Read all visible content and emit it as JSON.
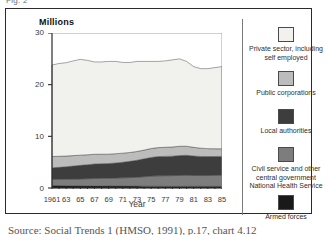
{
  "figure": {
    "number_label": "Fig. 2",
    "caption": "Source: Social Trends 1 (HMSO, 1991), p.17, chart 4.12"
  },
  "chart_data": {
    "type": "area",
    "stacked": true,
    "title": "",
    "ylabel": "Millions",
    "xlabel": "Year",
    "ylim": [
      0,
      30
    ],
    "yticks": [
      0,
      10,
      20,
      30
    ],
    "ytick_labels": [
      "0",
      "10",
      "20",
      "30"
    ],
    "xlim": [
      1961,
      1985
    ],
    "xticks": [
      1961,
      1963,
      1965,
      1967,
      1969,
      1971,
      1973,
      1975,
      1977,
      1979,
      1981,
      1983,
      1985
    ],
    "xtick_labels": [
      "1961",
      "63",
      "65",
      "67",
      "69",
      "71",
      "73",
      "75",
      "77",
      "79",
      "81",
      "83",
      "85"
    ],
    "grid": false,
    "legend_position": "right",
    "x": [
      1961,
      1962,
      1963,
      1964,
      1965,
      1966,
      1967,
      1968,
      1969,
      1970,
      1971,
      1972,
      1973,
      1974,
      1975,
      1976,
      1977,
      1978,
      1979,
      1980,
      1981,
      1982,
      1983,
      1984,
      1985
    ],
    "series": [
      {
        "name": "Armed forces",
        "color": "#191919",
        "values": [
          0.5,
          0.48,
          0.46,
          0.45,
          0.44,
          0.43,
          0.43,
          0.42,
          0.41,
          0.4,
          0.39,
          0.38,
          0.37,
          0.36,
          0.35,
          0.34,
          0.33,
          0.32,
          0.32,
          0.33,
          0.33,
          0.33,
          0.32,
          0.32,
          0.32
        ]
      },
      {
        "name": "Civil service and other central government National Health Service",
        "color": "#7d7d7d",
        "values": [
          1.2,
          1.22,
          1.25,
          1.28,
          1.32,
          1.36,
          1.42,
          1.46,
          1.48,
          1.52,
          1.58,
          1.64,
          1.72,
          1.82,
          1.95,
          2.02,
          2.05,
          2.08,
          2.12,
          2.14,
          2.1,
          2.08,
          2.1,
          2.14,
          2.18
        ]
      },
      {
        "name": "Local authorities",
        "color": "#3d3d3d",
        "values": [
          2.2,
          2.3,
          2.4,
          2.52,
          2.62,
          2.72,
          2.8,
          2.82,
          2.84,
          2.92,
          3.02,
          3.14,
          3.28,
          3.46,
          3.62,
          3.72,
          3.74,
          3.76,
          3.84,
          3.86,
          3.76,
          3.7,
          3.66,
          3.64,
          3.62
        ]
      },
      {
        "name": "Public corporations",
        "color": "#bcbcbc",
        "values": [
          2.2,
          2.14,
          2.08,
          2.02,
          1.98,
          1.92,
          1.88,
          1.84,
          1.82,
          1.8,
          1.76,
          1.72,
          1.7,
          1.7,
          1.72,
          1.74,
          1.76,
          1.78,
          1.8,
          1.76,
          1.68,
          1.6,
          1.54,
          1.5,
          1.46
        ]
      },
      {
        "name": "Private sector, including self employed",
        "color": "#f1f1ee",
        "values": [
          17.7,
          17.96,
          18.06,
          18.33,
          18.54,
          18.27,
          17.87,
          17.86,
          17.95,
          17.86,
          17.55,
          17.42,
          17.43,
          17.16,
          16.86,
          16.68,
          16.72,
          16.86,
          16.92,
          16.41,
          15.63,
          15.39,
          15.48,
          15.7,
          15.92
        ]
      }
    ],
    "totals": [
      23.8,
      24.1,
      24.25,
      24.6,
      24.9,
      24.7,
      24.4,
      24.4,
      24.5,
      24.5,
      24.3,
      24.3,
      24.5,
      24.5,
      24.5,
      24.5,
      24.6,
      24.8,
      25.0,
      24.5,
      23.5,
      23.1,
      23.1,
      23.3,
      23.5
    ]
  },
  "legend": {
    "items": [
      {
        "label": "Private sector, including self employed",
        "color": "#f1f1ee",
        "swatch": "legend-swatch-private-sector"
      },
      {
        "label": "Public corporations",
        "color": "#bcbcbc",
        "swatch": "legend-swatch-public-corporations"
      },
      {
        "label": "Local authorities",
        "color": "#3d3d3d",
        "swatch": "legend-swatch-local-authorities"
      },
      {
        "label": "Civil service and other central government National Health Service",
        "color": "#7d7d7d",
        "swatch": "legend-swatch-civil-service"
      },
      {
        "label": "Armed forces",
        "color": "#191919",
        "swatch": "legend-swatch-armed-forces"
      }
    ]
  }
}
